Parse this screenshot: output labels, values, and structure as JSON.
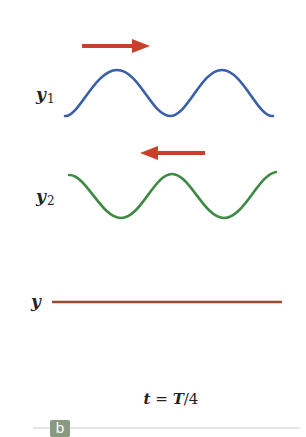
{
  "figure": {
    "panel_label": "b",
    "caption": {
      "t": "t",
      "eq": "=",
      "T": "T",
      "rest": "/4"
    },
    "waves": [
      {
        "name": "y",
        "subscript": "1",
        "color": "#3a5fa8",
        "direction": "right",
        "arrow_color": "#c8402a"
      },
      {
        "name": "y",
        "subscript": "2",
        "color": "#3e8a45",
        "direction": "left",
        "arrow_color": "#c8402a"
      },
      {
        "name": "y",
        "subscript": "",
        "color": "#9b4a36",
        "description": "resultant (flat)"
      }
    ],
    "colors": {
      "arrow": "#c8402a",
      "y1": "#3a5fa8",
      "y2": "#3e8a45",
      "sum": "#9b4a36",
      "rule": "#cccccc",
      "badge": "#8a9a7f"
    }
  }
}
